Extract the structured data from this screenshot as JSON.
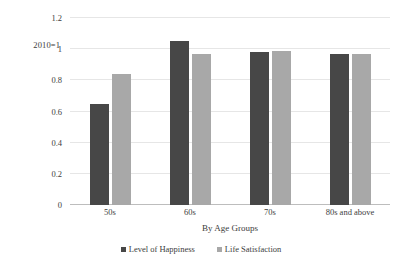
{
  "chart_data": {
    "type": "bar",
    "title": "",
    "subtitle": "",
    "categories": [
      "50s",
      "60s",
      "70s",
      "80s and above"
    ],
    "series": [
      {
        "name": "Level of Happiness",
        "color": "#474747",
        "values": [
          0.65,
          1.05,
          0.98,
          0.97
        ]
      },
      {
        "name": "Life Satisfaction",
        "color": "#a8a8a8",
        "values": [
          0.84,
          0.97,
          0.99,
          0.97
        ]
      }
    ],
    "xlabel": "By Age Groups",
    "ylabel": "",
    "ylim": [
      0,
      1.2
    ],
    "yticks": [
      "0",
      "0.2",
      "0.4",
      "0.6",
      "0.8",
      "1",
      "1.2"
    ],
    "ytick_values": [
      0,
      0.2,
      0.4,
      0.6,
      0.8,
      1,
      1.2
    ],
    "annotation": "2010=1",
    "grid": true,
    "legend_position": "bottom"
  },
  "axis": {
    "note": "2010=1",
    "x_title": "By Age Groups"
  },
  "legend": {
    "items": [
      {
        "label": "Level of Happiness"
      },
      {
        "label": "Life Satisfaction"
      }
    ]
  }
}
